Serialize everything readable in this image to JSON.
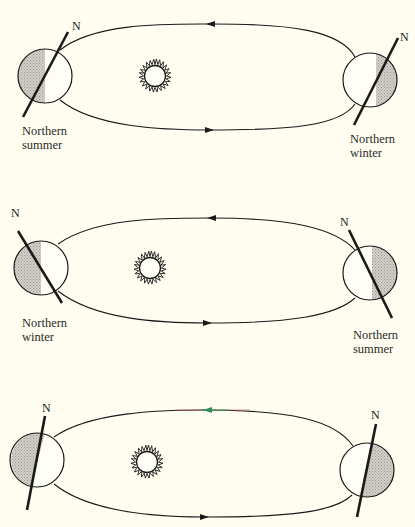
{
  "figure": {
    "colors": {
      "background": "#fffdf0",
      "line": "#1a1a1a",
      "shade": "#c9c6c0"
    },
    "panels": [
      {
        "id": "panel-1",
        "left_earth": {
          "pole_label": "N",
          "season_line1": "Northern",
          "season_line2": "summer"
        },
        "right_earth": {
          "pole_label": "N",
          "season_line1": "Northern",
          "season_line2": "winter"
        }
      },
      {
        "id": "panel-2",
        "left_earth": {
          "pole_label": "N",
          "season_line1": "Northern",
          "season_line2": "winter"
        },
        "right_earth": {
          "pole_label": "N",
          "season_line1": "Northern",
          "season_line2": "summer"
        }
      },
      {
        "id": "panel-3",
        "left_earth": {
          "pole_label": "N"
        },
        "right_earth": {
          "pole_label": "N"
        }
      }
    ]
  }
}
